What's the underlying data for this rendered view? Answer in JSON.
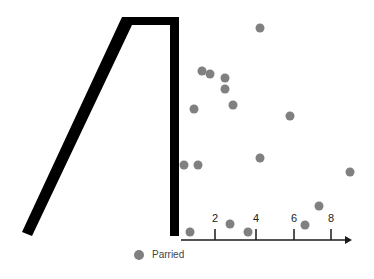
{
  "chart_data": {
    "type": "scatter",
    "title": "",
    "xlabel": "",
    "ylabel": "",
    "x_ticks": [
      {
        "label": "2",
        "px": 215
      },
      {
        "label": "4",
        "px": 256
      },
      {
        "label": "6",
        "px": 294
      },
      {
        "label": "8",
        "px": 331
      }
    ],
    "legend": [
      {
        "name": "Parried",
        "color": "#808080"
      }
    ],
    "legend_position": "bottom",
    "grid": false,
    "points_px": [
      [
        260,
        28
      ],
      [
        202,
        71
      ],
      [
        210,
        74
      ],
      [
        225,
        78
      ],
      [
        225,
        89
      ],
      [
        194,
        109
      ],
      [
        233,
        105
      ],
      [
        290,
        116
      ],
      [
        184,
        165
      ],
      [
        198,
        165
      ],
      [
        260,
        158
      ],
      [
        350,
        172
      ],
      [
        190,
        232
      ],
      [
        230,
        224
      ],
      [
        248,
        232
      ],
      [
        305,
        225
      ],
      [
        319,
        206
      ]
    ],
    "series": [
      {
        "name": "Parried",
        "color": "#808080"
      }
    ],
    "overlay_shape": "thick black outline resembling numeral 4 / trapezoid (left diagonal, top bar, right vertical)"
  },
  "axis": {
    "color": "#1a1a1a"
  },
  "shape": {
    "color": "#000000"
  },
  "point_color": "#808080"
}
